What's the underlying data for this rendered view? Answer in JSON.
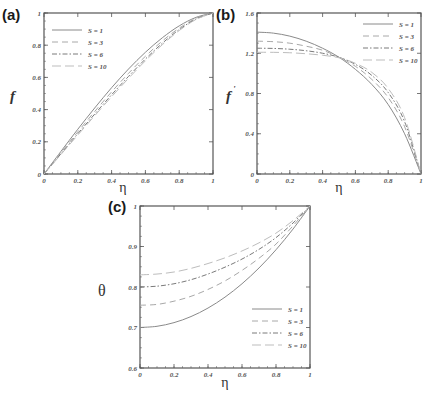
{
  "chart_data": [
    {
      "panel": "(a)",
      "type": "line",
      "title": "",
      "xlabel": "η",
      "ylabel": "f",
      "xlim": [
        0,
        1
      ],
      "ylim": [
        0,
        1
      ],
      "xticks": [
        "0",
        "0.2",
        "0.4",
        "0.6",
        "0.8",
        "1"
      ],
      "yticks": [
        "0",
        "0.2",
        "0.4",
        "0.6",
        "0.8",
        "1"
      ],
      "grid": false,
      "legend_position": "upper left",
      "x": [
        0,
        0.1,
        0.2,
        0.3,
        0.4,
        0.5,
        0.6,
        0.7,
        0.8,
        0.9,
        1.0
      ],
      "series": [
        {
          "name": "S = 1",
          "style": "solid",
          "values": [
            0,
            0.14,
            0.278,
            0.41,
            0.536,
            0.652,
            0.756,
            0.846,
            0.92,
            0.973,
            1.0
          ]
        },
        {
          "name": "S = 3",
          "style": "dashed",
          "values": [
            0,
            0.132,
            0.262,
            0.388,
            0.51,
            0.625,
            0.731,
            0.826,
            0.906,
            0.967,
            1.0
          ]
        },
        {
          "name": "S = 6",
          "style": "dashdot",
          "values": [
            0,
            0.125,
            0.25,
            0.372,
            0.492,
            0.606,
            0.714,
            0.812,
            0.897,
            0.963,
            1.0
          ]
        },
        {
          "name": "S = 10",
          "style": "longdash",
          "values": [
            0,
            0.121,
            0.242,
            0.362,
            0.48,
            0.594,
            0.703,
            0.803,
            0.891,
            0.96,
            1.0
          ]
        }
      ]
    },
    {
      "panel": "(b)",
      "type": "line",
      "title": "",
      "xlabel": "η",
      "ylabel": "f'",
      "xlim": [
        0,
        1
      ],
      "ylim": [
        0,
        1.6
      ],
      "xticks": [
        "0",
        "0.2",
        "0.4",
        "0.6",
        "0.8",
        "1"
      ],
      "yticks": [
        "0",
        "0.4",
        "0.8",
        "1.2",
        "1.6"
      ],
      "grid": false,
      "legend_position": "upper right",
      "x": [
        0,
        0.1,
        0.2,
        0.3,
        0.4,
        0.5,
        0.6,
        0.7,
        0.8,
        0.9,
        1.0
      ],
      "series": [
        {
          "name": "S = 1",
          "style": "solid",
          "values": [
            1.41,
            1.4,
            1.37,
            1.32,
            1.25,
            1.16,
            1.04,
            0.89,
            0.69,
            0.4,
            0.0
          ]
        },
        {
          "name": "S = 3",
          "style": "dashed",
          "values": [
            1.32,
            1.315,
            1.3,
            1.27,
            1.23,
            1.16,
            1.07,
            0.94,
            0.76,
            0.47,
            0.0
          ]
        },
        {
          "name": "S = 6",
          "style": "dashdot",
          "values": [
            1.25,
            1.248,
            1.24,
            1.225,
            1.2,
            1.16,
            1.09,
            0.98,
            0.81,
            0.52,
            0.0
          ]
        },
        {
          "name": "S = 10",
          "style": "longdash",
          "values": [
            1.21,
            1.209,
            1.205,
            1.195,
            1.18,
            1.155,
            1.1,
            1.01,
            0.85,
            0.56,
            0.0
          ]
        }
      ]
    },
    {
      "panel": "(c)",
      "type": "line",
      "title": "",
      "xlabel": "η",
      "ylabel": "θ",
      "xlim": [
        0,
        1
      ],
      "ylim": [
        0.6,
        1
      ],
      "xticks": [
        "0",
        "0.2",
        "0.4",
        "0.6",
        "0.8",
        "1"
      ],
      "yticks": [
        "0.6",
        "0.7",
        "0.8",
        "0.9",
        "1"
      ],
      "grid": false,
      "legend_position": "lower right",
      "x": [
        0,
        0.1,
        0.2,
        0.3,
        0.4,
        0.5,
        0.6,
        0.7,
        0.8,
        0.9,
        1.0
      ],
      "series": [
        {
          "name": "S = 1",
          "style": "solid",
          "values": [
            0.7,
            0.703,
            0.712,
            0.727,
            0.748,
            0.775,
            0.808,
            0.847,
            0.892,
            0.943,
            1.0
          ]
        },
        {
          "name": "S = 3",
          "style": "dashed",
          "values": [
            0.755,
            0.757,
            0.765,
            0.777,
            0.794,
            0.815,
            0.841,
            0.871,
            0.906,
            0.951,
            1.0
          ]
        },
        {
          "name": "S = 6",
          "style": "dashdot",
          "values": [
            0.8,
            0.802,
            0.808,
            0.818,
            0.832,
            0.849,
            0.869,
            0.893,
            0.922,
            0.958,
            1.0
          ]
        },
        {
          "name": "S = 10",
          "style": "longdash",
          "values": [
            0.83,
            0.832,
            0.837,
            0.846,
            0.858,
            0.872,
            0.889,
            0.909,
            0.933,
            0.964,
            1.0
          ]
        }
      ]
    }
  ],
  "panels": {
    "a": {
      "label": "(a)",
      "ylabel": "f",
      "xlabel": "η"
    },
    "b": {
      "label": "(b)",
      "ylabel": "f",
      "ylabel_prime": "'",
      "xlabel": "η"
    },
    "c": {
      "label": "(c)",
      "ylabel": "θ",
      "xlabel": "η"
    }
  },
  "legend": [
    "S = 1",
    "S = 3",
    "S = 6",
    "S = 10"
  ],
  "colors": {
    "axis": "#555555",
    "S1": "#8a8a8a",
    "S3": "#a8a8a8",
    "S6": "#7a7a7a",
    "S10": "#bdbdbd"
  }
}
